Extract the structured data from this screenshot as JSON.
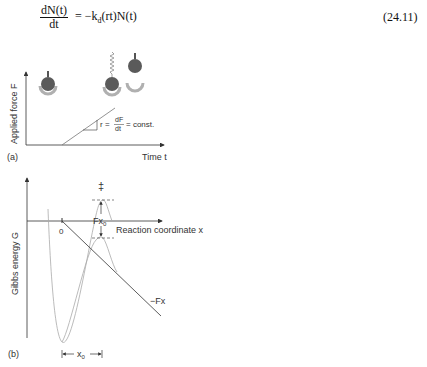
{
  "equation": {
    "numerator": "dN(t)",
    "denominator": "dt",
    "rhs": "= −k",
    "rhs_sub": "d",
    "rhs_tail": "(rt)N(t)",
    "number": "(24.11)"
  },
  "figure": {
    "panel_a": {
      "label": "(a)",
      "ylabel": "Applied force F",
      "xlabel": "Time t",
      "slope_annotation": {
        "lhs": "r =",
        "num": "dF",
        "den": "dt",
        "rhs": "= const."
      },
      "icons": [
        "bead-in-cup-icon",
        "stretched-bead-with-spring-icon",
        "detached-bead-icon",
        "empty-cup-icon"
      ]
    },
    "panel_b": {
      "label": "(b)",
      "ylabel": "Gibbs energy G",
      "xlabel": "Reaction coordinate x",
      "origin_label": "0",
      "transition_state_symbol": "‡",
      "barrier_shift_label": "Fx",
      "barrier_shift_sub": "0",
      "tilt_label": "−Fx",
      "distance_label": "x",
      "distance_sub": "0"
    }
  },
  "colors": {
    "line": "#333333",
    "curve": "#9a9a9a",
    "bead_fill": "#5a5a5a",
    "cup_fill": "#b0b0b0"
  }
}
